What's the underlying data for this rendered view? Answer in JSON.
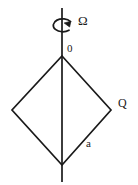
{
  "figure": {
    "background_color": "#ffffff",
    "stroke_color": "#1a1a1a",
    "axis": {
      "name": "rotation-axis",
      "x": 62,
      "y_top": 8,
      "y_bottom": 182,
      "stroke_width": 1.6
    },
    "rotation_arrow": {
      "name": "rotation-arrow",
      "description": "curved arrow encircling the vertical axis indicating spin",
      "center_x": 62,
      "center_y": 25,
      "radius_x": 9,
      "radius_y": 6
    },
    "rhombus": {
      "name": "rhombus-outline",
      "stroke_width": 1.6,
      "vertices": [
        {
          "id": "top",
          "label": "0",
          "x": 62,
          "y": 56
        },
        {
          "id": "right",
          "label": "Q",
          "x": 111,
          "y": 110
        },
        {
          "id": "bottom",
          "label": "",
          "x": 62,
          "y": 165
        },
        {
          "id": "left",
          "label": "",
          "x": 12,
          "y": 110
        }
      ]
    },
    "labels": {
      "omega": "Ω",
      "origin": "0",
      "q": "Q",
      "side": "a"
    }
  }
}
